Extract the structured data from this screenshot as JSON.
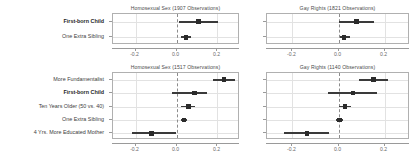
{
  "figure": {
    "background": "#ffffff",
    "marker_color": "#2b2b2b",
    "grid_color": "#e2e2e2",
    "zero_line_color": "#8c8c8c"
  },
  "chart_data": [
    {
      "id": "top-left",
      "type": "scatter",
      "title": "Homosexual Sex (1907 Observations)",
      "xlabel": "",
      "ylabel": "",
      "xlim": [
        -0.31,
        0.31
      ],
      "xticks": [
        -0.2,
        0.0,
        0.2
      ],
      "xticklabels": [
        "-0.2",
        "0.0",
        "0.2"
      ],
      "grid": true,
      "zero_line": 0.0,
      "categories": [
        "First-born Child",
        "One Extra Sibling"
      ],
      "bold_categories": [
        "First-born Child"
      ],
      "estimates": [
        0.108,
        0.047
      ],
      "ci_low": [
        0.013,
        0.022
      ],
      "ci_high": [
        0.205,
        0.072
      ]
    },
    {
      "id": "top-right",
      "type": "scatter",
      "title": "Gay Rights (1821 Observations)",
      "xlabel": "",
      "ylabel": "",
      "xlim": [
        -0.31,
        0.31
      ],
      "xticks": [
        -0.2,
        0.0,
        0.2
      ],
      "xticklabels": [
        "-0.2",
        "0.0",
        "0.2"
      ],
      "grid": true,
      "zero_line": 0.0,
      "categories": [
        "First-born Child",
        "One Extra Sibling"
      ],
      "bold_categories": [
        "First-born Child"
      ],
      "estimates": [
        0.078,
        0.024
      ],
      "ci_low": [
        0.0,
        0.008
      ],
      "ci_high": [
        0.155,
        0.049
      ]
    },
    {
      "id": "bottom-left",
      "type": "scatter",
      "title": "Homosexual Sex (1517 Observations)",
      "xlabel": "",
      "ylabel": "",
      "xlim": [
        -0.31,
        0.31
      ],
      "xticks": [
        -0.2,
        0.0,
        0.2
      ],
      "xticklabels": [
        "-0.2",
        "0.0",
        "0.2"
      ],
      "grid": true,
      "zero_line": 0.0,
      "categories": [
        "More Fundamentalist",
        "First-born Child",
        "Ten Years Older (50 vs. 40)",
        "One Extra Sibling",
        "4 Yrs. More Educated Mother"
      ],
      "bold_categories": [
        "First-born Child"
      ],
      "estimates": [
        0.232,
        0.087,
        0.058,
        0.036,
        -0.121
      ],
      "ci_low": [
        0.178,
        -0.022,
        0.021,
        0.024,
        -0.215
      ],
      "ci_high": [
        0.287,
        0.148,
        0.092,
        0.049,
        -0.002
      ]
    },
    {
      "id": "bottom-right",
      "type": "scatter",
      "title": "Gay Rights (1140 Observations)",
      "xlabel": "",
      "ylabel": "",
      "xlim": [
        -0.31,
        0.31
      ],
      "xticks": [
        -0.2,
        0.0,
        0.2
      ],
      "xticklabels": [
        "-0.2",
        "0.0",
        "0.2"
      ],
      "grid": true,
      "zero_line": 0.0,
      "categories": [
        "More Fundamentalist",
        "First-born Child",
        "Ten Years Older (50 vs. 40)",
        "One Extra Sibling",
        "4 Yrs. More Educated Mother"
      ],
      "bold_categories": [
        "First-born Child"
      ],
      "estimates": [
        0.152,
        0.063,
        0.028,
        0.004,
        -0.137
      ],
      "ci_low": [
        0.088,
        -0.046,
        0.002,
        -0.012,
        -0.235
      ],
      "ci_high": [
        0.215,
        0.168,
        0.055,
        0.021,
        -0.042
      ]
    }
  ]
}
